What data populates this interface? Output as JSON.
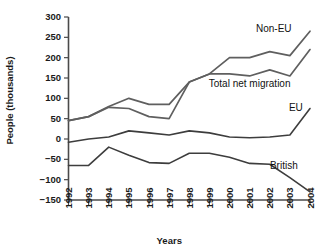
{
  "chart_data": {
    "type": "line",
    "title": "",
    "xlabel": "Years",
    "ylabel": "People (thousands)",
    "categories": [
      "1992",
      "1993",
      "1994",
      "1995",
      "1996",
      "1997",
      "1998",
      "1999",
      "2000",
      "2001",
      "2002",
      "2003",
      "2004"
    ],
    "x": [
      1992,
      1993,
      1994,
      1995,
      1996,
      1997,
      1998,
      1999,
      2000,
      2001,
      2002,
      2003,
      2004
    ],
    "ylim": [
      -150,
      300
    ],
    "xlim": [
      1992,
      2004
    ],
    "yticks": [
      -150,
      -100,
      -50,
      0,
      50,
      100,
      150,
      200,
      250,
      300
    ],
    "ytick_labels": [
      "−150",
      "−100",
      "−50",
      "0",
      "50",
      "100",
      "150",
      "200",
      "250",
      "300"
    ],
    "grid": false,
    "legend": "inline-labels",
    "series": [
      {
        "name": "Non-EU",
        "color": "#5f5f5f",
        "width": 1.7,
        "values": [
          45,
          55,
          80,
          100,
          85,
          85,
          140,
          160,
          200,
          200,
          215,
          205,
          265
        ]
      },
      {
        "name": "Total net migration",
        "color": "#5f5f5f",
        "width": 1.7,
        "values": [
          45,
          55,
          78,
          75,
          55,
          50,
          140,
          160,
          160,
          155,
          170,
          155,
          220
        ]
      },
      {
        "name": "EU",
        "color": "#3d3d3d",
        "width": 1.6,
        "values": [
          -8,
          0,
          5,
          20,
          15,
          10,
          20,
          15,
          5,
          3,
          5,
          10,
          75
        ]
      },
      {
        "name": "British",
        "color": "#3d3d3d",
        "width": 1.6,
        "values": [
          -65,
          -65,
          -20,
          -40,
          -58,
          -60,
          -35,
          -35,
          -45,
          -60,
          -62,
          -95,
          -130
        ]
      }
    ],
    "annotations": [
      {
        "text": "Non-EU",
        "x": 2002.2,
        "y": 262,
        "anchor": "middle"
      },
      {
        "text": "Total net migration",
        "x": 2001.0,
        "y": 128,
        "anchor": "middle"
      },
      {
        "text": "EU",
        "x": 2003.3,
        "y": 70,
        "anchor": "middle"
      },
      {
        "text": "British",
        "x": 2002.7,
        "y": -73,
        "anchor": "middle"
      }
    ]
  }
}
